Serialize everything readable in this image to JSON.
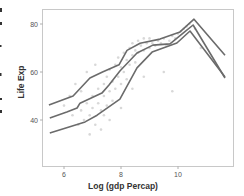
{
  "chart_data": {
    "type": "line",
    "title": "",
    "xlabel": "Log (gdp Percap)",
    "ylabel": "Life Exp",
    "xlim": [
      5.3,
      11.9
    ],
    "ylim": [
      21,
      86
    ],
    "grid": false,
    "legend": null,
    "x_ticks": [
      6,
      8,
      10
    ],
    "x_tick_labels": [
      "6",
      "8",
      "10"
    ],
    "y_ticks": [
      40,
      60,
      80
    ],
    "y_tick_labels": [
      "40",
      "60",
      "80"
    ],
    "line_color": "#6b6b6b",
    "scatter_color": "#b8b8b8",
    "series": [
      {
        "name": "upper",
        "x": [
          5.47,
          6.32,
          6.91,
          7.35,
          7.93,
          8.21,
          8.67,
          9.37,
          10.07,
          10.56,
          11.65
        ],
        "y": [
          46.2,
          50.0,
          57.5,
          60.0,
          63.0,
          69.0,
          72.0,
          73.7,
          76.7,
          82.0,
          67.0
        ]
      },
      {
        "name": "middle",
        "x": [
          5.5,
          6.1,
          6.46,
          6.56,
          7.33,
          7.58,
          7.96,
          8.56,
          9.12,
          9.72,
          10.18,
          10.53,
          11.65
        ],
        "y": [
          40.8,
          43.3,
          45.0,
          47.0,
          51.2,
          54.6,
          60.4,
          67.9,
          71.2,
          71.7,
          76.2,
          79.6,
          57.5
        ]
      },
      {
        "name": "lower",
        "x": [
          5.5,
          6.74,
          7.16,
          7.96,
          8.56,
          9.09,
          9.96,
          10.42,
          11.65
        ],
        "y": [
          34.6,
          39.2,
          42.0,
          48.7,
          61.7,
          68.3,
          72.1,
          77.1,
          57.9
        ]
      }
    ],
    "scatter": {
      "description": "faint grey point cloud of Life Exp vs Log (gdp Percap), dense between x 6.3-10.5",
      "approx_points": [
        [
          6.3,
          42
        ],
        [
          6.5,
          38
        ],
        [
          6.6,
          44
        ],
        [
          6.7,
          40
        ],
        [
          6.8,
          47
        ],
        [
          6.9,
          42
        ],
        [
          7.0,
          50
        ],
        [
          7.0,
          45
        ],
        [
          7.1,
          38
        ],
        [
          7.2,
          53
        ],
        [
          7.2,
          47
        ],
        [
          7.3,
          44
        ],
        [
          7.4,
          55
        ],
        [
          7.4,
          50
        ],
        [
          7.5,
          58
        ],
        [
          7.5,
          46
        ],
        [
          7.6,
          52
        ],
        [
          7.6,
          61
        ],
        [
          7.7,
          48
        ],
        [
          7.7,
          56
        ],
        [
          7.8,
          63
        ],
        [
          7.8,
          53
        ],
        [
          7.9,
          58
        ],
        [
          7.9,
          66
        ],
        [
          8.0,
          55
        ],
        [
          8.0,
          62
        ],
        [
          8.1,
          68
        ],
        [
          8.1,
          60
        ],
        [
          8.2,
          65
        ],
        [
          8.2,
          57
        ],
        [
          8.3,
          70
        ],
        [
          8.3,
          63
        ],
        [
          8.4,
          67
        ],
        [
          8.4,
          72
        ],
        [
          8.5,
          69
        ],
        [
          8.5,
          64
        ],
        [
          8.6,
          73
        ],
        [
          8.6,
          68
        ],
        [
          8.7,
          71
        ],
        [
          8.8,
          74
        ],
        [
          8.8,
          69
        ],
        [
          8.9,
          72
        ],
        [
          9.0,
          70
        ],
        [
          9.0,
          74
        ],
        [
          9.1,
          72
        ],
        [
          9.2,
          71
        ],
        [
          9.3,
          73
        ],
        [
          9.4,
          72
        ],
        [
          9.5,
          74
        ],
        [
          9.6,
          71
        ],
        [
          9.7,
          73
        ],
        [
          9.8,
          75
        ],
        [
          9.9,
          74
        ],
        [
          10.0,
          76
        ],
        [
          10.1,
          77
        ],
        [
          10.2,
          78
        ],
        [
          10.3,
          79
        ],
        [
          10.4,
          80
        ],
        [
          6.0,
          46
        ],
        [
          6.2,
          50
        ],
        [
          6.4,
          55
        ],
        [
          6.8,
          60
        ],
        [
          7.3,
          36
        ],
        [
          7.6,
          40
        ],
        [
          8.8,
          58
        ],
        [
          9.5,
          60
        ],
        [
          6.9,
          34
        ],
        [
          7.1,
          63
        ],
        [
          8.0,
          45
        ],
        [
          9.8,
          52
        ],
        [
          8.4,
          53
        ],
        [
          7.4,
          42
        ],
        [
          6.6,
          52
        ],
        [
          10.6,
          78
        ],
        [
          10.8,
          70
        ]
      ]
    }
  },
  "edge_marks": {
    "note": "cut-off fragments at the far left edge"
  }
}
